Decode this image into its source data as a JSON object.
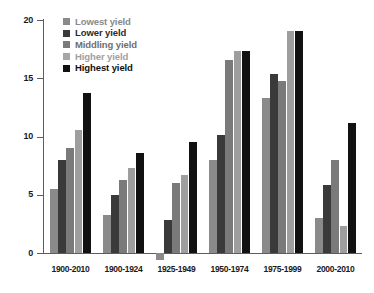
{
  "chart_data": {
    "type": "bar",
    "title": "",
    "subtitle": "",
    "xlabel": "",
    "ylabel": "",
    "ylim": [
      0,
      20
    ],
    "yticks": [
      0,
      5,
      10,
      15,
      20
    ],
    "ytick_labels": [
      "0",
      "5",
      "10",
      "15",
      "20"
    ],
    "grid": false,
    "legend_position": "top-left",
    "categories": [
      "1900-2010",
      "1900-1924",
      "1925-1949",
      "1950-1974",
      "1975-1999",
      "2000-2010"
    ],
    "series": [
      {
        "name": "Lowest yield",
        "color": "#8a8a8a",
        "values": [
          5.5,
          3.3,
          -0.6,
          8.0,
          13.3,
          3.0
        ]
      },
      {
        "name": "Lower yield",
        "color": "#3a3a3a",
        "values": [
          8.0,
          5.0,
          2.8,
          10.1,
          15.4,
          5.8
        ]
      },
      {
        "name": "Middling yield",
        "color": "#7a7a7a",
        "values": [
          9.0,
          6.3,
          6.0,
          16.6,
          14.8,
          8.0
        ]
      },
      {
        "name": "Higher yield",
        "color": "#9e9e9e",
        "values": [
          10.6,
          7.3,
          6.7,
          17.3,
          19.1,
          2.3
        ]
      },
      {
        "name": "Highest yield",
        "color": "#111111",
        "values": [
          13.7,
          8.6,
          9.5,
          17.3,
          19.1,
          11.2
        ]
      }
    ]
  },
  "legend": {
    "items": [
      {
        "label": "Lowest yield",
        "swatch": "#8a8a8a",
        "text_color": "#8a8a8a"
      },
      {
        "label": "Lower yield",
        "swatch": "#3a3a3a",
        "text_color": "#2b2b2b"
      },
      {
        "label": "Middling yield",
        "swatch": "#7a7a7a",
        "text_color": "#6e6e6e"
      },
      {
        "label": "Higher yield",
        "swatch": "#a6a6a6",
        "text_color": "#a0a0a0"
      },
      {
        "label": "Highest yield",
        "swatch": "#111111",
        "text_color": "#111111"
      }
    ]
  }
}
